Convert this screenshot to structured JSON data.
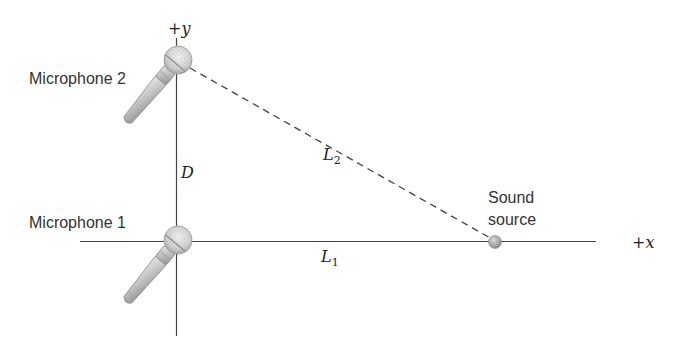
{
  "diagram": {
    "axes": {
      "y_label": "+y",
      "x_label": "+x"
    },
    "microphones": [
      {
        "label": "Microphone 1",
        "position": "origin"
      },
      {
        "label": "Microphone 2",
        "position": "on +y axis at distance D"
      }
    ],
    "source": {
      "label_line1": "Sound",
      "label_line2": "source"
    },
    "distances": {
      "D": "D",
      "L1_main": "L",
      "L1_sub": "1",
      "L2_main": "L",
      "L2_sub": "2"
    },
    "colors": {
      "axis": "#444444",
      "mic_body": "#b8b8b8",
      "source": "#9a9a9a",
      "text": "#333333"
    }
  }
}
